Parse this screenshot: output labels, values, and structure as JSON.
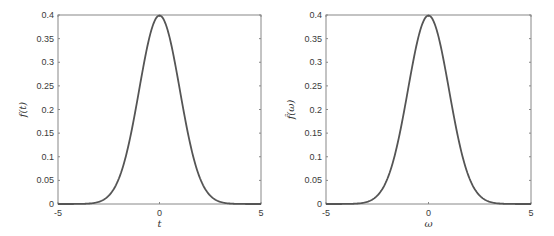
{
  "chart_data": [
    {
      "type": "line",
      "title": "",
      "xlabel": "t",
      "ylabel": "f(t)",
      "xlim": [
        -5,
        5
      ],
      "ylim": [
        0,
        0.4
      ],
      "xticks": [
        -5,
        0,
        5
      ],
      "xtick_labels": [
        "-5",
        "0",
        "5"
      ],
      "yticks": [
        0,
        0.05,
        0.1,
        0.15,
        0.2,
        0.25,
        0.3,
        0.35,
        0.4
      ],
      "ytick_labels": [
        "0",
        "0.05",
        "0.1",
        "0.15",
        "0.2",
        "0.25",
        "0.3",
        "0.35",
        "0.4"
      ],
      "grid": false,
      "legend": null,
      "series": [
        {
          "name": "f(t)",
          "description": "Gaussian, mean 0, std 1",
          "x": [
            -5,
            -4,
            -3,
            -2.5,
            -2,
            -1.5,
            -1,
            -0.5,
            0,
            0.5,
            1,
            1.5,
            2,
            2.5,
            3,
            4,
            5
          ],
          "y": [
            0.0,
            0.0001,
            0.0044,
            0.0175,
            0.054,
            0.1295,
            0.242,
            0.3521,
            0.3989,
            0.3521,
            0.242,
            0.1295,
            0.054,
            0.0175,
            0.0044,
            0.0001,
            0.0
          ]
        }
      ]
    },
    {
      "type": "line",
      "title": "",
      "xlabel": "ω",
      "ylabel": "f̂(ω)",
      "xlim": [
        -5,
        5
      ],
      "ylim": [
        0,
        0.4
      ],
      "xticks": [
        -5,
        0,
        5
      ],
      "xtick_labels": [
        "-5",
        "0",
        "5"
      ],
      "yticks": [
        0,
        0.05,
        0.1,
        0.15,
        0.2,
        0.25,
        0.3,
        0.35,
        0.4
      ],
      "ytick_labels": [
        "0",
        "0.05",
        "0.1",
        "0.15",
        "0.2",
        "0.25",
        "0.3",
        "0.35",
        "0.4"
      ],
      "grid": false,
      "legend": null,
      "series": [
        {
          "name": "f̂(ω)",
          "description": "Gaussian, mean 0, std 1",
          "x": [
            -5,
            -4,
            -3,
            -2.5,
            -2,
            -1.5,
            -1,
            -0.5,
            0,
            0.5,
            1,
            1.5,
            2,
            2.5,
            3,
            4,
            5
          ],
          "y": [
            0.0,
            0.0001,
            0.0044,
            0.0175,
            0.054,
            0.1295,
            0.242,
            0.3521,
            0.3989,
            0.3521,
            0.242,
            0.1295,
            0.054,
            0.0175,
            0.0044,
            0.0001,
            0.0
          ]
        }
      ]
    }
  ],
  "style": {
    "line_color": "#555555",
    "axis_color": "#888888",
    "text_color": "#3a3a3a"
  },
  "layout": {
    "panels": [
      {
        "x0": 58,
        "x1": 261,
        "y0": 15,
        "y1": 204
      },
      {
        "x0": 326,
        "x1": 531,
        "y0": 15,
        "y1": 204
      }
    ]
  }
}
